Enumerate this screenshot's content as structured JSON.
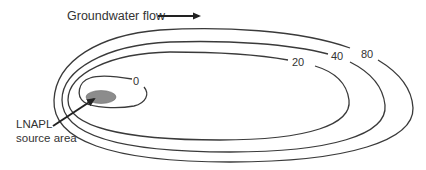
{
  "title": {
    "text": "Groundwater flow",
    "arrow": "right-arrow"
  },
  "contours": [
    {
      "label": "0"
    },
    {
      "label": "20"
    },
    {
      "label": "40"
    },
    {
      "label": "80"
    }
  ],
  "source": {
    "line1": "LNAPL",
    "line2": "source area",
    "fill_color": "#8c8c8c"
  },
  "colors": {
    "line": "#3a3a3a",
    "text": "#333333",
    "background": "#ffffff"
  }
}
